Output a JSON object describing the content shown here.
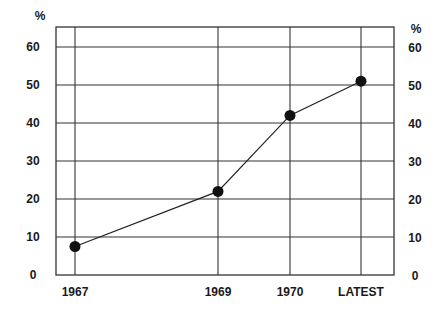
{
  "chart_data": {
    "type": "line",
    "title": "",
    "xlabel": "",
    "ylabel": "%",
    "ylabel_right": "%",
    "categories": [
      "1967",
      "1969",
      "1970",
      "LATEST"
    ],
    "series": [
      {
        "name": "",
        "values": [
          7.5,
          22,
          42,
          51
        ]
      }
    ],
    "ylim": [
      0,
      60
    ],
    "yticks": [
      0,
      10,
      20,
      30,
      40,
      50,
      60
    ],
    "grid": true,
    "legend": null,
    "markers": "filled-circle",
    "colors": {
      "line": "#222222",
      "marker": "#111111",
      "grid": "#333333"
    }
  },
  "axis": {
    "left_unit": "%",
    "right_unit": "%",
    "yticks": [
      "0",
      "10",
      "20",
      "30",
      "40",
      "50",
      "60"
    ],
    "xticks": [
      "1967",
      "1969",
      "1970",
      "LATEST"
    ]
  }
}
